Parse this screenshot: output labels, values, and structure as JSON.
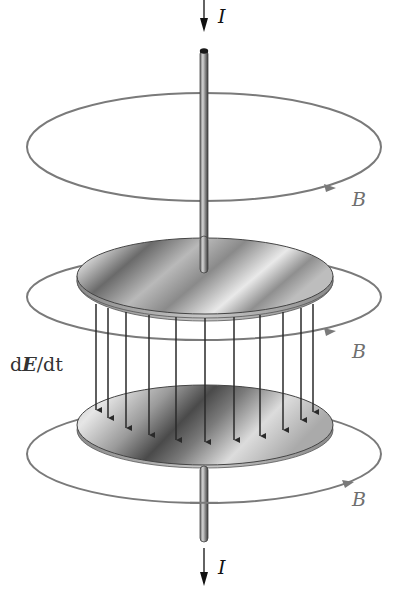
{
  "figure": {
    "labels": {
      "current_top": "I",
      "current_bottom": "I",
      "field_top": "B",
      "field_middle": "B",
      "field_bottom": "B",
      "displacement_prefix": "d",
      "displacement_E": "E",
      "displacement_suffix": "/dt"
    },
    "colors": {
      "wire": "#555555",
      "wire_highlight": "#cfcfcf",
      "field_loop": "#7a7a7a",
      "e_field_arrow": "#2a2a2a",
      "plate_dark": "#3a3a3a",
      "plate_light": "#e8e8e8",
      "label_I": "#111111",
      "label_B": "#6f6f6f"
    },
    "e_field_arrow_count": 11
  }
}
